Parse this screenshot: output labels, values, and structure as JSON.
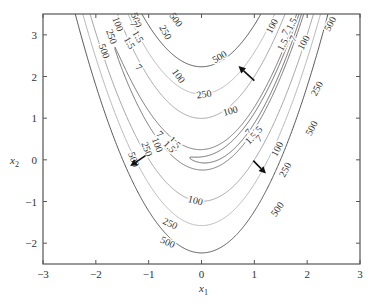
{
  "chart_data": {
    "type": "contour",
    "title": "",
    "function": "100*(x2 - x1^2)^2 + (1 - x1)^2",
    "xlabel": "x",
    "xlabel_sub": "1",
    "ylabel": "x",
    "ylabel_sub": "2",
    "xlim": [
      -3,
      3
    ],
    "ylim": [
      -2.5,
      3.5
    ],
    "xticks": [
      -3,
      -2,
      -1,
      0,
      1,
      2,
      3
    ],
    "xtick_labels": [
      "−3",
      "−2",
      "−1",
      "0",
      "1",
      "2",
      "3"
    ],
    "yticks": [
      -2,
      -1,
      0,
      1,
      2,
      3
    ],
    "ytick_labels": [
      "−2",
      "−1",
      "0",
      "1",
      "2",
      "3"
    ],
    "grid": false,
    "levels": [
      {
        "value": 1.5,
        "label": "1.5",
        "color": "#555555"
      },
      {
        "value": 7,
        "label": "7",
        "color": "#666666"
      },
      {
        "value": 100,
        "label": "100",
        "color": "#9a9a9a"
      },
      {
        "value": 250,
        "label": "250",
        "color": "#b0b0b0"
      },
      {
        "value": 500,
        "label": "500",
        "color": "#444444"
      }
    ],
    "contour_labels": [
      {
        "text": "500",
        "x1": -1.25,
        "x2": 3.35,
        "rot": 70
      },
      {
        "text": "250",
        "x1": -1.72,
        "x2": 2.95,
        "rot": 70
      },
      {
        "text": "100",
        "x1": -1.6,
        "x2": 3.25,
        "rot": 70
      },
      {
        "text": "500",
        "x1": -1.86,
        "x2": 2.6,
        "rot": 70
      },
      {
        "text": "7",
        "x1": -1.3,
        "x2": 3.25,
        "rot": 60
      },
      {
        "text": "1.5",
        "x1": -1.22,
        "x2": 2.95,
        "rot": 60
      },
      {
        "text": "1.5",
        "x1": -1.38,
        "x2": 2.8,
        "rot": 60
      },
      {
        "text": "7",
        "x1": -1.2,
        "x2": 2.2,
        "rot": 45
      },
      {
        "text": "250",
        "x1": -0.7,
        "x2": 3.05,
        "rot": 62
      },
      {
        "text": "500",
        "x1": -0.5,
        "x2": 3.35,
        "rot": 55
      },
      {
        "text": "100",
        "x1": -0.45,
        "x2": 2.0,
        "rot": 55
      },
      {
        "text": "500",
        "x1": 0.35,
        "x2": 2.45,
        "rot": -30
      },
      {
        "text": "250",
        "x1": 0.05,
        "x2": 1.55,
        "rot": -8
      },
      {
        "text": "100",
        "x1": 0.55,
        "x2": 1.15,
        "rot": -15
      },
      {
        "text": "100",
        "x1": 1.35,
        "x2": 3.2,
        "rot": -62
      },
      {
        "text": "7",
        "x1": 1.6,
        "x2": 3.05,
        "rot": -62
      },
      {
        "text": "1.5",
        "x1": 1.72,
        "x2": 3.25,
        "rot": -62
      },
      {
        "text": "1.5",
        "x1": 1.55,
        "x2": 2.75,
        "rot": -62
      },
      {
        "text": "7",
        "x1": 1.75,
        "x2": 2.9,
        "rot": -62
      },
      {
        "text": "100",
        "x1": 1.95,
        "x2": 2.8,
        "rot": -62
      },
      {
        "text": "500",
        "x1": 2.45,
        "x2": 3.25,
        "rot": -62
      },
      {
        "text": "250",
        "x1": 2.2,
        "x2": 1.7,
        "rot": -62
      },
      {
        "text": "500",
        "x1": 2.1,
        "x2": 0.75,
        "rot": -62
      },
      {
        "text": "7",
        "x1": 0.9,
        "x2": 0.65,
        "rot": -45
      },
      {
        "text": "1.5",
        "x1": 1.05,
        "x2": 0.65,
        "rot": -45
      },
      {
        "text": "1.5",
        "x1": 0.95,
        "x2": 0.5,
        "rot": -45
      },
      {
        "text": "7",
        "x1": 1.1,
        "x2": 0.5,
        "rot": -45
      },
      {
        "text": "100",
        "x1": 1.45,
        "x2": 0.25,
        "rot": -62
      },
      {
        "text": "250",
        "x1": 1.6,
        "x2": -0.25,
        "rot": -62
      },
      {
        "text": "500",
        "x1": 1.45,
        "x2": -1.2,
        "rot": -55
      },
      {
        "text": "100",
        "x1": -0.85,
        "x2": 0.35,
        "rot": 70
      },
      {
        "text": "250",
        "x1": -1.05,
        "x2": 0.25,
        "rot": 70
      },
      {
        "text": "500",
        "x1": -1.3,
        "x2": 0.0,
        "rot": 70
      },
      {
        "text": "7",
        "x1": -0.55,
        "x2": 0.2,
        "rot": 45
      },
      {
        "text": "1.5",
        "x1": -0.52,
        "x2": 0.4,
        "rot": 45
      },
      {
        "text": "1.5",
        "x1": -0.62,
        "x2": 0.3,
        "rot": 45
      },
      {
        "text": "7",
        "x1": -0.8,
        "x2": 0.6,
        "rot": 45
      },
      {
        "text": "100",
        "x1": -0.12,
        "x2": -1.0,
        "rot": 15
      },
      {
        "text": "250",
        "x1": -0.6,
        "x2": -1.55,
        "rot": 25
      },
      {
        "text": "500",
        "x1": -0.65,
        "x2": -2.0,
        "rot": 25
      }
    ],
    "arrows": [
      {
        "from": [
          1.0,
          1.9
        ],
        "to": [
          0.7,
          2.25
        ],
        "direction": "up-left"
      },
      {
        "from": [
          -1.06,
          0.1
        ],
        "to": [
          -1.35,
          -0.15
        ],
        "direction": "down-left"
      },
      {
        "from": [
          0.98,
          -0.02
        ],
        "to": [
          1.22,
          -0.33
        ],
        "direction": "down-right"
      }
    ]
  }
}
